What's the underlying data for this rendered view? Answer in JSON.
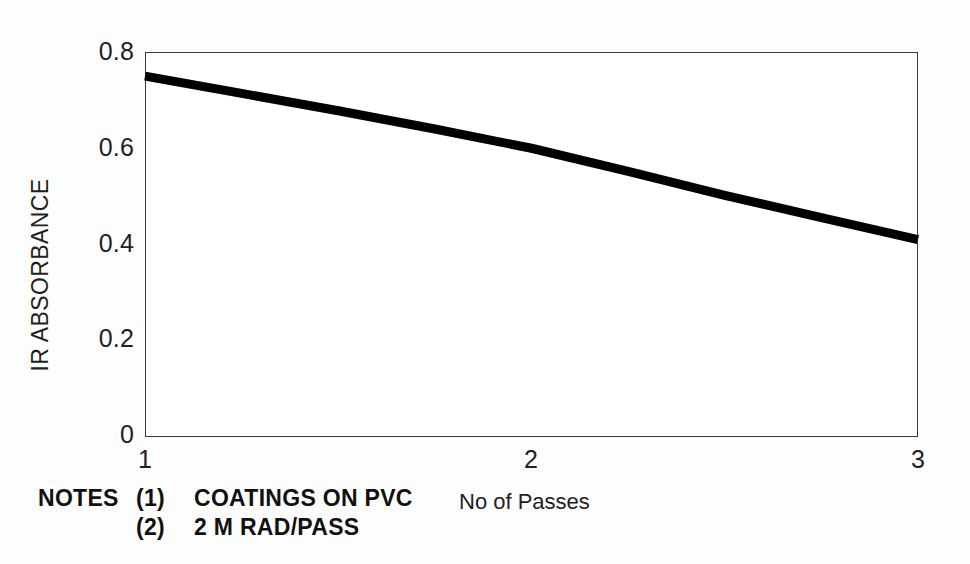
{
  "chart_data": {
    "type": "line",
    "title": "",
    "xlabel": "No of Passes",
    "ylabel": "IR ABSORBANCE",
    "xlim": [
      1,
      3
    ],
    "ylim": [
      0,
      0.8
    ],
    "grid": false,
    "legend": "none",
    "x_ticks": [
      "1",
      "2",
      "3"
    ],
    "x_tick_values": [
      1,
      2,
      3
    ],
    "y_ticks": [
      "0",
      "0.2",
      "0.4",
      "0.6",
      "0.8"
    ],
    "y_tick_values": [
      0,
      0.2,
      0.4,
      0.6,
      0.8
    ],
    "series": [
      {
        "name": "IR absorbance vs passes",
        "x": [
          1.0,
          1.25,
          1.5,
          1.75,
          2.0,
          2.25,
          2.5,
          2.75,
          3.0
        ],
        "values": [
          0.75,
          0.714,
          0.678,
          0.64,
          0.6,
          0.552,
          0.502,
          0.456,
          0.41
        ],
        "color": "#000000",
        "line_width_px": 9
      }
    ],
    "annotations": [
      "NOTES (1) COATINGS ON PVC",
      "(2) 2 M RAD/PASS"
    ]
  },
  "axes": {
    "y_title": "IR ABSORBANCE",
    "x_title": "No of Passes",
    "y_tick_labels": [
      "0.8",
      "0.6",
      "0.4",
      "0.2",
      "0"
    ],
    "x_tick_labels": [
      "1",
      "2",
      "3"
    ]
  },
  "notes": {
    "heading": "NOTES",
    "items": [
      {
        "marker": "(1)",
        "text": "COATINGS ON PVC"
      },
      {
        "marker": "(2)",
        "text": "2 M RAD/PASS"
      }
    ]
  },
  "colors": {
    "line": "#000000",
    "frame": "#3a3a3a",
    "text": "#1f1f1f",
    "background": "#fdfdfd"
  }
}
